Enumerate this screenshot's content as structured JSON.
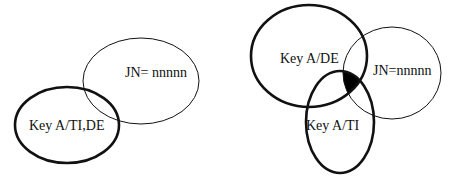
{
  "diagrams": [
    {
      "id": "left",
      "sets": [
        {
          "label": "JN= nnnnn",
          "style": "thin"
        },
        {
          "label": "Key A/TI,DE",
          "style": "thick"
        }
      ]
    },
    {
      "id": "right",
      "sets": [
        {
          "label": "Key A/DE",
          "style": "thick"
        },
        {
          "label": "JN=nnnnn",
          "style": "thin"
        },
        {
          "label": "Key A/TI",
          "style": "thick"
        }
      ],
      "highlighted_region": "intersection of Key A/DE, Key A/TI and JN=nnnnn (filled black)"
    }
  ],
  "colors": {
    "stroke": "#111111",
    "fill_highlight": "#000000",
    "background": "#ffffff"
  }
}
